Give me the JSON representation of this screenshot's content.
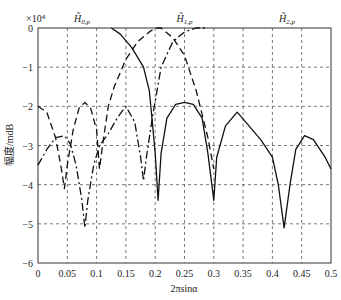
{
  "chart_data": {
    "type": "line",
    "title": "",
    "xlabel": "2πsinα",
    "ylabel": "幅度/mdB",
    "y_multiplier": "×10⁴",
    "xlim": [
      0,
      0.5
    ],
    "ylim": [
      -6,
      0
    ],
    "grid": true,
    "x_ticks": [
      "0",
      "0.05",
      "0.1",
      "0.15",
      "0.2",
      "0.25",
      "0.3",
      "0.35",
      "0.4",
      "0.45",
      "0.5"
    ],
    "y_ticks": [
      "0",
      "-1",
      "-2",
      "-3",
      "-4",
      "-5",
      "-6"
    ],
    "legend_position": "top-annotations",
    "series": [
      {
        "name": "H̃0,p",
        "label_base": "H̃",
        "label_sub": "0,p",
        "style": "dashed",
        "label_x": 0.075,
        "points": [
          [
            0,
            -2.0
          ],
          [
            0.015,
            -2.15
          ],
          [
            0.03,
            -2.8
          ],
          [
            0.04,
            -3.6
          ],
          [
            0.045,
            -4.1
          ],
          [
            0.05,
            -3.5
          ],
          [
            0.06,
            -2.6
          ],
          [
            0.07,
            -2.05
          ],
          [
            0.08,
            -1.9
          ],
          [
            0.09,
            -2.05
          ],
          [
            0.1,
            -2.6
          ],
          [
            0.105,
            -3.6
          ],
          [
            0.11,
            -3.0
          ],
          [
            0.12,
            -2.0
          ],
          [
            0.13,
            -1.5
          ],
          [
            0.15,
            -0.8
          ],
          [
            0.17,
            -0.35
          ],
          [
            0.19,
            -0.1
          ],
          [
            0.2,
            0
          ],
          [
            0.21,
            0
          ],
          [
            0.23,
            -0.25
          ],
          [
            0.25,
            -0.7
          ],
          [
            0.27,
            -1.6
          ],
          [
            0.29,
            -2.8
          ],
          [
            0.3,
            -3.6
          ]
        ]
      },
      {
        "name": "H̃1,p",
        "label_base": "H̃",
        "label_sub": "1,p",
        "style": "solid",
        "label_x": 0.25,
        "points": [
          [
            0.125,
            0
          ],
          [
            0.14,
            -0.15
          ],
          [
            0.16,
            -0.5
          ],
          [
            0.18,
            -1.0
          ],
          [
            0.19,
            -1.6
          ],
          [
            0.195,
            -2.4
          ],
          [
            0.2,
            -3.2
          ],
          [
            0.205,
            -4.4
          ],
          [
            0.21,
            -3.2
          ],
          [
            0.22,
            -2.3
          ],
          [
            0.235,
            -1.95
          ],
          [
            0.25,
            -1.9
          ],
          [
            0.265,
            -1.95
          ],
          [
            0.28,
            -2.3
          ],
          [
            0.29,
            -3.2
          ],
          [
            0.3,
            -4.4
          ],
          [
            0.305,
            -3.3
          ],
          [
            0.32,
            -2.5
          ],
          [
            0.34,
            -2.15
          ],
          [
            0.36,
            -2.5
          ],
          [
            0.38,
            -2.85
          ],
          [
            0.4,
            -3.3
          ],
          [
            0.41,
            -4.0
          ],
          [
            0.42,
            -5.1
          ],
          [
            0.43,
            -4.0
          ],
          [
            0.44,
            -3.1
          ],
          [
            0.455,
            -2.75
          ],
          [
            0.47,
            -2.85
          ],
          [
            0.49,
            -3.3
          ],
          [
            0.5,
            -3.6
          ]
        ]
      },
      {
        "name": "H̃2,p",
        "label_base": "H̃",
        "label_sub": "2,p",
        "style": "dash-dot",
        "label_x": 0.425,
        "points": [
          [
            0,
            -3.5
          ],
          [
            0.015,
            -3.1
          ],
          [
            0.03,
            -2.8
          ],
          [
            0.045,
            -2.75
          ],
          [
            0.055,
            -2.95
          ],
          [
            0.065,
            -3.5
          ],
          [
            0.075,
            -4.4
          ],
          [
            0.08,
            -5.1
          ],
          [
            0.085,
            -4.4
          ],
          [
            0.095,
            -3.5
          ],
          [
            0.105,
            -3.0
          ],
          [
            0.12,
            -2.7
          ],
          [
            0.135,
            -2.3
          ],
          [
            0.15,
            -2.0
          ],
          [
            0.165,
            -2.4
          ],
          [
            0.175,
            -3.3
          ],
          [
            0.18,
            -3.9
          ],
          [
            0.185,
            -3.3
          ],
          [
            0.195,
            -2.3
          ],
          [
            0.21,
            -1.0
          ],
          [
            0.23,
            -0.35
          ],
          [
            0.25,
            -0.1
          ],
          [
            0.27,
            0
          ],
          [
            0.29,
            0
          ]
        ]
      }
    ]
  }
}
